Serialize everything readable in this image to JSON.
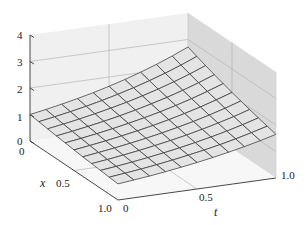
{
  "chart_data": {
    "type": "surface",
    "title": "",
    "xlabel": "x",
    "tlabel": "t",
    "zlabel": "",
    "x_ticks": [
      "0",
      "0.5",
      "1.0"
    ],
    "t_ticks": [
      "0",
      "0.5",
      "1.0"
    ],
    "z_ticks": [
      "0",
      "1",
      "2",
      "3",
      "4"
    ],
    "x_range": [
      0,
      1
    ],
    "t_range": [
      0,
      1
    ],
    "z_range": [
      0,
      4
    ],
    "grid_divisions": 10,
    "surface_formula": "z = exp(t - x/2)",
    "corner_values": {
      "x0_t0": 1.0,
      "x0_t1": 2.72,
      "x1_t0": 0.61,
      "x1_t1": 1.65
    },
    "colors": {
      "surface_fill": "#e4e4e4",
      "mesh_line": "#3a3a3a",
      "back_wall": "#f0f0f0",
      "right_wall": "#d9d9d9",
      "floor": "#f7f7f7",
      "wall_grid": "#b5b5b5",
      "axis": "#333333"
    }
  }
}
